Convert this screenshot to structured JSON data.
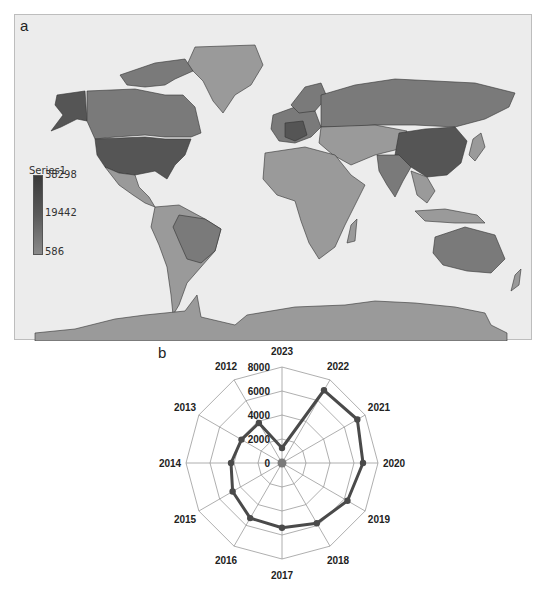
{
  "panels": {
    "a_label": "a",
    "b_label": "b"
  },
  "map": {
    "legend": {
      "title": "Series1",
      "max": "38298",
      "mid": "19442",
      "min": "586"
    },
    "colors": {
      "ocean": "#ececec",
      "low": "#9a9a9a",
      "mid": "#7a7a7a",
      "high": "#555555",
      "border": "#333333"
    },
    "highlighted_regions": [
      {
        "name": "USA",
        "shade": "high"
      },
      {
        "name": "China",
        "shade": "high"
      },
      {
        "name": "Alaska",
        "shade": "high"
      },
      {
        "name": "Western Europe",
        "shade": "high"
      },
      {
        "name": "Canada",
        "shade": "mid"
      },
      {
        "name": "Russia",
        "shade": "mid"
      },
      {
        "name": "Brazil",
        "shade": "mid"
      },
      {
        "name": "India",
        "shade": "mid"
      },
      {
        "name": "Australia",
        "shade": "mid"
      }
    ]
  },
  "chart_data": [
    {
      "type": "choropleth_map",
      "title": "",
      "legend_title": "Series1",
      "legend_range": [
        586,
        38298
      ],
      "legend_ticks": [
        38298,
        19442,
        586
      ]
    },
    {
      "type": "radar",
      "title": "",
      "categories": [
        "2023",
        "2022",
        "2021",
        "2020",
        "2019",
        "2018",
        "2017",
        "2016",
        "2015",
        "2014",
        "2013",
        "2012"
      ],
      "series": [
        {
          "name": "Series1",
          "values": [
            1250,
            7000,
            7250,
            6750,
            6300,
            5800,
            5400,
            5300,
            4750,
            4250,
            3900,
            3850
          ]
        }
      ],
      "radial_ticks": [
        "0",
        "2000",
        "4000",
        "6000",
        "8000"
      ],
      "rlim": [
        0,
        8000
      ],
      "grid": true,
      "legend": "none"
    }
  ]
}
